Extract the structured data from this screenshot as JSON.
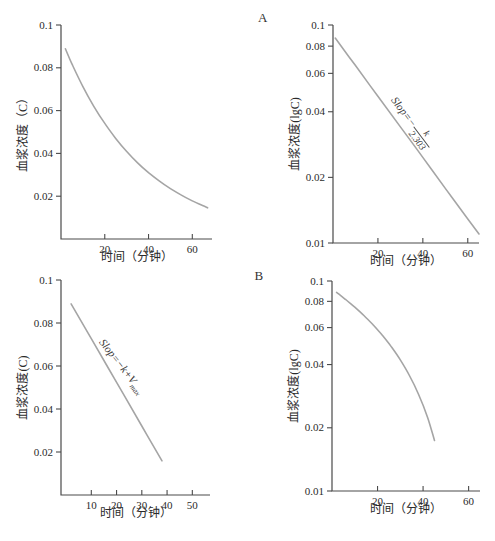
{
  "figure": {
    "panel_labels": {
      "a": "A",
      "b": "B"
    },
    "colors": {
      "curve": "#a5a5a5",
      "axis": "#4a4a4a",
      "text": "#2b2b2b",
      "background": "#ffffff"
    }
  },
  "chart_data": [
    {
      "id": "top-left",
      "type": "line",
      "title": "",
      "xlabel": "时间（分钟）",
      "ylabel": "血浆浓度（C）",
      "xscale": "linear",
      "yscale": "linear",
      "xlim": [
        0,
        69
      ],
      "ylim": [
        0,
        0.1
      ],
      "xticks": [
        20,
        40,
        60
      ],
      "yticks": [
        0.1,
        0.08,
        0.06,
        0.04,
        0.02
      ],
      "grid": false,
      "series": [
        {
          "name": "plasma-concentration-first-order",
          "x": [
            2,
            5,
            10,
            15,
            20,
            25,
            30,
            35,
            40,
            45,
            50,
            55,
            60,
            65,
            67
          ],
          "y": [
            0.0889,
            0.0818,
            0.0712,
            0.062,
            0.054,
            0.047,
            0.0409,
            0.0356,
            0.031,
            0.027,
            0.0235,
            0.0205,
            0.0178,
            0.0155,
            0.0146
          ]
        }
      ],
      "annotation": null,
      "box": {
        "left": 61,
        "top": 25,
        "right": 212,
        "bottom": 239
      }
    },
    {
      "id": "top-right",
      "type": "line",
      "title": "",
      "xlabel": "时间（分钟）",
      "ylabel": "血浆浓度(lgC)",
      "xscale": "linear",
      "yscale": "log",
      "xlim": [
        0,
        65
      ],
      "ylim": [
        0.01,
        0.1
      ],
      "xticks": [
        20,
        40,
        60
      ],
      "yticks": [
        0.1,
        0.08,
        0.06,
        0.04,
        0.02,
        0.01
      ],
      "grid": false,
      "series": [
        {
          "name": "plasma-concentration-first-order-semilog",
          "x": [
            1,
            10,
            20,
            30,
            40,
            50,
            60,
            65
          ],
          "y": [
            0.0871,
            0.0651,
            0.0471,
            0.0341,
            0.0247,
            0.0178,
            0.0129,
            0.011
          ]
        }
      ],
      "annotation": {
        "kind": "fraction",
        "prefix": "Slop=−",
        "numerator": "k",
        "denominator": "2.303",
        "angle_deg": 53,
        "center_x": 411,
        "center_y": 123
      },
      "box": {
        "left": 333,
        "top": 25,
        "right": 479,
        "bottom": 243
      }
    },
    {
      "id": "bottom-left",
      "type": "line",
      "title": "",
      "xlabel": "时间（分钟）",
      "ylabel": "血浆浓度(C)",
      "xscale": "linear",
      "yscale": "linear",
      "xlim": [
        -2,
        57
      ],
      "ylim": [
        0,
        0.1
      ],
      "xticks": [
        10,
        20,
        30,
        40,
        50
      ],
      "yticks": [
        0.1,
        0.08,
        0.06,
        0.04,
        0.02
      ],
      "grid": false,
      "series": [
        {
          "name": "plasma-concentration-zero-order",
          "x": [
            2,
            10,
            20,
            30,
            38
          ],
          "y": [
            0.0889,
            0.0727,
            0.0524,
            0.0321,
            0.0159
          ]
        }
      ],
      "annotation": {
        "kind": "subscript",
        "text": "Slop=−k+V",
        "sub": "max",
        "angle_deg": 52,
        "center_x": 121,
        "center_y": 367
      },
      "box": {
        "left": 61,
        "top": 280,
        "right": 210,
        "bottom": 495
      }
    },
    {
      "id": "bottom-right",
      "type": "line",
      "title": "",
      "xlabel": "时间（分钟）",
      "ylabel": "血浆浓度(lgC)",
      "xscale": "linear",
      "yscale": "log",
      "xlim": [
        0,
        65
      ],
      "ylim": [
        0.01,
        0.1
      ],
      "xticks": [
        20,
        40,
        60
      ],
      "yticks": [
        0.1,
        0.08,
        0.06,
        0.04,
        0.02,
        0.01
      ],
      "grid": false,
      "series": [
        {
          "name": "plasma-concentration-zero-order-semilog",
          "x": [
            2,
            6,
            10,
            14,
            18,
            22,
            26,
            30,
            34,
            38,
            42,
            45
          ],
          "y": [
            0.0882,
            0.0816,
            0.075,
            0.0685,
            0.0619,
            0.0553,
            0.0487,
            0.0421,
            0.0355,
            0.0289,
            0.0224,
            0.0174
          ]
        }
      ],
      "annotation": null,
      "box": {
        "left": 332,
        "top": 281,
        "right": 480,
        "bottom": 491
      }
    }
  ]
}
